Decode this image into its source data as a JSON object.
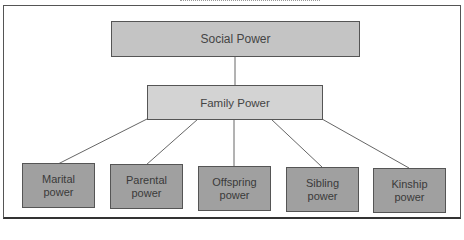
{
  "diagram": {
    "type": "hierarchy",
    "root": {
      "label": "Social Power"
    },
    "middle": {
      "label": "Family Power"
    },
    "leaves": [
      {
        "line1": "Marital",
        "line2": "power"
      },
      {
        "line1": "Parental",
        "line2": "power"
      },
      {
        "line1": "Offspring",
        "line2": "power"
      },
      {
        "line1": "Sibling",
        "line2": "power"
      },
      {
        "line1": "Kinship",
        "line2": "power"
      }
    ],
    "colors": {
      "root_fill": "#c4c4c4",
      "middle_fill": "#d3d3d3",
      "leaf_fill": "#a0a0a0",
      "line": "#666666"
    }
  }
}
